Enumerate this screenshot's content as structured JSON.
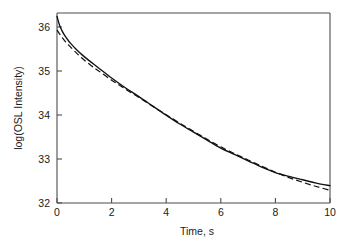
{
  "figure": {
    "background_color": "#ffffff",
    "ink_color": "#111111",
    "axis_color": "#4d4d4d"
  },
  "chart_data": {
    "type": "line",
    "title": "",
    "subtitle": "",
    "xlabel": "Time, s",
    "ylabel": "log(OSL Intensity)",
    "xlim": [
      0,
      10
    ],
    "ylim": [
      32,
      36.5
    ],
    "xticks": [
      0,
      2,
      4,
      6,
      8,
      10
    ],
    "xtick_labels": [
      "0",
      "2",
      "4",
      "6",
      "8",
      "10"
    ],
    "yticks": [
      32,
      33,
      34,
      35,
      36
    ],
    "ytick_labels": [
      "32",
      "33",
      "34",
      "35",
      "36"
    ],
    "grid": false,
    "legend": null,
    "legend_position": "none",
    "annotations": [],
    "series": [
      {
        "name": "measured OSL decay curve",
        "style": "solid",
        "color": "#111111",
        "x": [
          0.0,
          0.1,
          0.2,
          0.3,
          0.4,
          0.5,
          0.7,
          0.9,
          1.2,
          1.5,
          2.0,
          2.5,
          3.0,
          3.5,
          4.0,
          4.5,
          5.0,
          5.5,
          6.0,
          6.5,
          7.0,
          7.5,
          8.0,
          8.5,
          9.0,
          9.5,
          10.0
        ],
        "y": [
          36.42,
          36.2,
          36.06,
          35.95,
          35.86,
          35.78,
          35.64,
          35.52,
          35.36,
          35.21,
          34.96,
          34.73,
          34.52,
          34.3,
          34.08,
          33.87,
          33.68,
          33.49,
          33.3,
          33.15,
          33.0,
          32.85,
          32.72,
          32.63,
          32.55,
          32.47,
          32.41
        ]
      },
      {
        "name": "fitted sum-of-exponentials curve",
        "style": "dashed",
        "color": "#111111",
        "x": [
          0.0,
          0.1,
          0.2,
          0.3,
          0.4,
          0.5,
          0.7,
          0.9,
          1.2,
          1.5,
          2.0,
          2.5,
          3.0,
          3.5,
          4.0,
          4.5,
          5.0,
          5.5,
          6.0,
          6.5,
          7.0,
          7.5,
          8.0,
          8.5,
          9.0,
          9.5,
          10.0
        ],
        "y": [
          36.1,
          36.0,
          35.91,
          35.83,
          35.76,
          35.69,
          35.56,
          35.44,
          35.28,
          35.14,
          34.91,
          34.7,
          34.5,
          34.29,
          34.09,
          33.89,
          33.7,
          33.51,
          33.33,
          33.17,
          33.02,
          32.87,
          32.73,
          32.6,
          32.49,
          32.39,
          32.3
        ]
      }
    ]
  },
  "geometry": {
    "plot_left": 57,
    "plot_right": 330,
    "plot_top": 13,
    "plot_bottom": 203
  }
}
